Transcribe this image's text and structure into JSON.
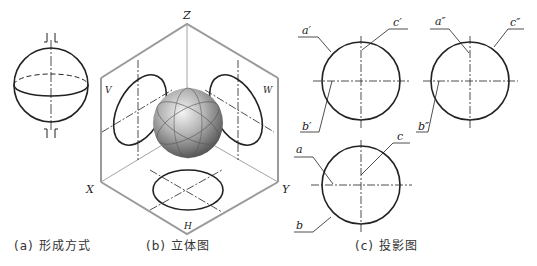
{
  "captions": {
    "a": "(a) 形成方式",
    "b": "(b) 立体图",
    "c": "(c) 投影图"
  },
  "stereo": {
    "axis_z": "Z",
    "axis_x": "X",
    "axis_y": "Y",
    "plane_v": "V",
    "plane_w": "W",
    "plane_h": "H"
  },
  "projection": {
    "front": {
      "a": "a′",
      "b": "b′",
      "c": "c′"
    },
    "side": {
      "a": "a″",
      "b": "b″",
      "c": "c″"
    },
    "top": {
      "a": "a",
      "b": "b",
      "c": "c"
    }
  },
  "colors": {
    "line": "#222222",
    "frame": "#9a9a9a",
    "sphere_light": "#f2f2f2",
    "sphere_dark": "#5a5a5a"
  }
}
